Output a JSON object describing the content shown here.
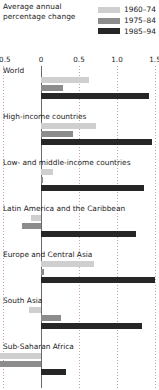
{
  "title": "Average annual percentage change",
  "legend": [
    {
      "label": "1960–74",
      "color": "#cfcfcf",
      "key": "1960-74"
    },
    {
      "label": "1975–84",
      "color": "#8c8c8c",
      "key": "1975-84"
    },
    {
      "label": "1985–94",
      "color": "#262626",
      "key": "1985-94"
    }
  ],
  "axis": {
    "ticks": [
      "–0.5",
      "0",
      "0.5",
      "1.0",
      "1.5"
    ],
    "tick_values": [
      -0.5,
      0,
      0.5,
      1.0,
      1.5
    ],
    "min": -0.5,
    "max": 1.5
  },
  "colors": {
    "series_1960_74": "#cfcfcf",
    "series_1975_84": "#8c8c8c",
    "series_1985_94": "#262626",
    "gridline": "#c9a3a3",
    "zero_line": "#6a6a6a",
    "text": "#1d1d1d",
    "background": "#ffffff"
  },
  "chart_data": {
    "type": "bar",
    "orientation": "horizontal",
    "title": "Average annual percentage change",
    "xlabel": "",
    "ylabel": "",
    "xlim": [
      -0.5,
      1.5
    ],
    "grid": true,
    "legend_position": "top-right",
    "categories": [
      "World",
      "High-income countries",
      "Low- and middle-income countries",
      "Latin America and the Caribbean",
      "Europe and Central Asia",
      "South Asia",
      "Sub-Saharan Africa"
    ],
    "series": [
      {
        "name": "1960–74",
        "color": "#cfcfcf",
        "values": [
          0.63,
          0.73,
          0.16,
          -0.13,
          0.7,
          -0.16,
          -0.65
        ]
      },
      {
        "name": "1975–84",
        "color": "#8c8c8c",
        "values": [
          0.29,
          0.42,
          0.03,
          -0.25,
          0.04,
          0.26,
          -0.74
        ]
      },
      {
        "name": "1985–94",
        "color": "#262626",
        "values": [
          1.42,
          1.46,
          1.36,
          1.25,
          1.5,
          1.33,
          0.33
        ]
      }
    ]
  }
}
